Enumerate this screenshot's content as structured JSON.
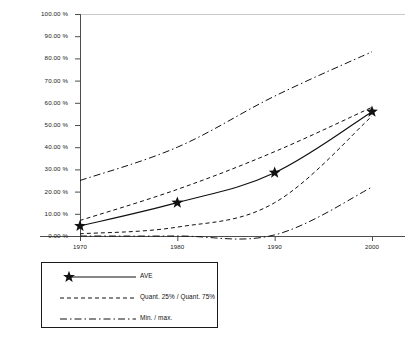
{
  "chart_data": {
    "type": "line",
    "title": "",
    "xlabel": "",
    "ylabel": "",
    "x": [
      1970,
      1980,
      1990,
      2000
    ],
    "categories": [
      "1970",
      "1980",
      "1990",
      "2000"
    ],
    "xlim": [
      1965,
      2005
    ],
    "ylim": [
      0,
      100
    ],
    "yticks": [
      0,
      10,
      20,
      30,
      40,
      50,
      60,
      70,
      80,
      90,
      100
    ],
    "ytick_labels": [
      "0.00 %",
      "10.00 %",
      "20.00 %",
      "30.00 %",
      "40.00 %",
      "50.00 %",
      "60.00 %",
      "70.00 %",
      "80.00 %",
      "90.00 %",
      "100.00 %"
    ],
    "xtick_labels": [
      "1970",
      "1980",
      "1990",
      "2000"
    ],
    "grid": false,
    "legend_position": "below-left",
    "series": [
      {
        "name": "AVE",
        "style": "solid",
        "marker": "star",
        "values": [
          4.5,
          15.0,
          28.5,
          56.0
        ]
      },
      {
        "name": "Quant. 75%",
        "style": "dashed",
        "marker": "none",
        "values": [
          7.0,
          21.0,
          38.0,
          58.0
        ]
      },
      {
        "name": "Quant. 25%",
        "style": "dashed",
        "marker": "none",
        "values": [
          1.0,
          4.0,
          15.0,
          54.0
        ]
      },
      {
        "name": "max.",
        "style": "dashdot",
        "marker": "none",
        "values": [
          25.0,
          40.0,
          63.0,
          83.0
        ]
      },
      {
        "name": "min.",
        "style": "dashdot",
        "marker": "none",
        "values": [
          0.0,
          0.0,
          0.5,
          22.0
        ]
      }
    ],
    "legend_entries": [
      {
        "label": "AVE",
        "style": "solid",
        "marker": "star"
      },
      {
        "label": "Quant. 25% / Quant. 75%",
        "style": "dashed",
        "marker": "none"
      },
      {
        "label": "Min. / max.",
        "style": "dashdot",
        "marker": "none"
      }
    ],
    "colors": {
      "line": "#111111",
      "axis": "#555555",
      "background": "#ffffff"
    }
  }
}
